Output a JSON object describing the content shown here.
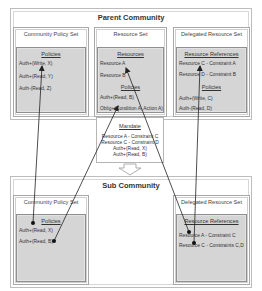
{
  "parent": {
    "title": "Parent Community",
    "community_policy_set": {
      "title": "Community Policy Set",
      "heading": "Policies",
      "items": [
        "Auth+(Write, X)",
        "Auth+(Read, Y)",
        "Auth-(Read, Z)"
      ]
    },
    "resource_set": {
      "title": "Resource Set",
      "resources_heading": "Resources",
      "resources": [
        "Resource A",
        "Resource B"
      ],
      "policies_heading": "Policies",
      "policies": [
        "Auth+(Read, B)",
        "Oblig+(Condition A, Action A)"
      ]
    },
    "delegated_resource_set": {
      "title": "Delegated Resource Set",
      "references_heading": "Resource References",
      "references": [
        "Resource C - Constraint A",
        "Resource D - Constraint B"
      ],
      "policies_heading": "Policies",
      "policies": [
        "Auth+(Write, C)",
        "Auth-(Read, D)"
      ]
    }
  },
  "mandate": {
    "title": "Mandate",
    "lines": [
      "Resource A - Constraint C",
      "Resource C - Constraint D",
      "Auth+(Read, X)",
      "Auth+(Read, B)"
    ]
  },
  "sub": {
    "title": "Sub Community",
    "community_policy_set": {
      "title": "Community Policy Set",
      "heading": "Policies",
      "items": [
        "Auth+(Read, X)",
        "Auth+(Read, B)"
      ]
    },
    "delegated_resource_set": {
      "title": "Delegated Resource Set",
      "references_heading": "Resource References",
      "references": [
        "Resource A - Constraint C",
        "Resource C - Constraints C,D"
      ]
    }
  },
  "colors": {
    "inner_fill": "#d5d5d5",
    "border": "#a8a8a8",
    "line": "#222222"
  }
}
